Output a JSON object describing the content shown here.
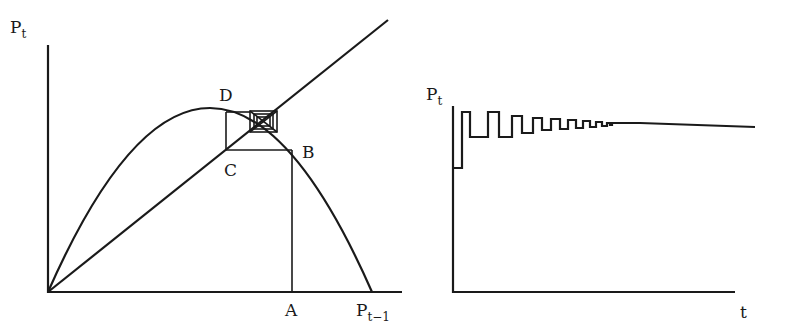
{
  "left_panel": {
    "y_axis_label": "P",
    "y_axis_subscript": "t",
    "x_axis_label": "P",
    "x_axis_subscript": "t−1",
    "points": {
      "A": "A",
      "B": "B",
      "C": "C",
      "D": "D"
    },
    "curves": [
      "45-degree line P_t = P_{t-1}",
      "hump-shaped map (parabola)"
    ],
    "features": [
      "cobweb path converging to fixed point",
      "rectangle D-C-B"
    ]
  },
  "right_panel": {
    "y_axis_label": "P",
    "y_axis_subscript": "t",
    "x_axis_label": "t",
    "series": "damped oscillation converging to steady state"
  },
  "colors": {
    "ink": "#1a1a1a",
    "background": "#ffffff"
  }
}
